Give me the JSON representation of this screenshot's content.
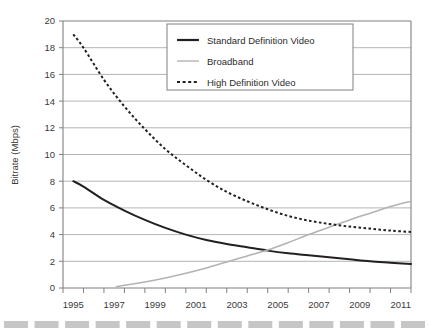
{
  "chart_data": {
    "type": "line",
    "title": "",
    "xlabel": "",
    "ylabel": "Bitrate (Mbps)",
    "xlim": [
      1995,
      2012
    ],
    "ylim": [
      0,
      20
    ],
    "ytick_step": 2,
    "grid": true,
    "grid_axis": "y",
    "legend_position": "top-center-right",
    "xticks": [
      1995,
      1996,
      1997,
      1998,
      1999,
      2000,
      2001,
      2002,
      2003,
      2004,
      2005,
      2006,
      2007,
      2008,
      2009,
      2010,
      2011,
      2012
    ],
    "xtick_labels": [
      "1995",
      "1997",
      "1999",
      "2001",
      "2003",
      "2005",
      "2007",
      "2009",
      "2011"
    ],
    "xtick_label_years": [
      1995,
      1997,
      1999,
      2001,
      2003,
      2005,
      2007,
      2009,
      2011
    ],
    "yticks": [
      0,
      2,
      4,
      6,
      8,
      10,
      12,
      14,
      16,
      18,
      20
    ],
    "ytick_labels": [
      "0",
      "2",
      "4",
      "6",
      "8",
      "10",
      "12",
      "14",
      "16",
      "18",
      "20"
    ],
    "series": [
      {
        "name": "Standard Definition Video",
        "style": "solid",
        "color": "#231f20",
        "width": 2.0,
        "x": [
          1995.5,
          1996,
          1997,
          1998,
          1999,
          2000,
          2001,
          2002,
          2003,
          2004,
          2005,
          2006,
          2007,
          2008,
          2009,
          2010,
          2011,
          2012
        ],
        "y": [
          8.0,
          7.6,
          6.6,
          5.8,
          5.1,
          4.5,
          4.0,
          3.6,
          3.3,
          3.05,
          2.8,
          2.6,
          2.45,
          2.3,
          2.15,
          2.0,
          1.9,
          1.8
        ]
      },
      {
        "name": "Broadband",
        "style": "solid",
        "color": "#b3b3b3",
        "width": 1.6,
        "x": [
          1997.6,
          1998,
          1999,
          2000,
          2001,
          2002,
          2003,
          2004,
          2005,
          2006,
          2007,
          2008,
          2009,
          2010,
          2011,
          2012
        ],
        "y": [
          0.1,
          0.2,
          0.45,
          0.75,
          1.1,
          1.5,
          1.95,
          2.4,
          2.85,
          3.4,
          4.0,
          4.55,
          5.1,
          5.6,
          6.1,
          6.5
        ]
      },
      {
        "name": "High Definition Video",
        "style": "dotted",
        "color": "#231f20",
        "width": 2.0,
        "x": [
          1995.5,
          1996,
          1997,
          1998,
          1999,
          2000,
          2001,
          2002,
          2003,
          2004,
          2005,
          2006,
          2007,
          2008,
          2009,
          2010,
          2011,
          2012
        ],
        "y": [
          19.0,
          18.0,
          15.6,
          13.6,
          11.9,
          10.4,
          9.2,
          8.1,
          7.2,
          6.5,
          5.9,
          5.4,
          5.05,
          4.8,
          4.6,
          4.45,
          4.3,
          4.2
        ]
      }
    ]
  },
  "legend": {
    "items": [
      {
        "label": "Standard Definition Video",
        "swatch": "solid-dark-thick"
      },
      {
        "label": "Broadband",
        "swatch": "solid-gray-thin"
      },
      {
        "label": "High Definition Video",
        "swatch": "dotted-dark"
      }
    ]
  },
  "axes": {
    "y_title": "Bitrate (Mbps)"
  },
  "decoration": {
    "footer_bar_name": "dashed-divider-bar",
    "footer_bar_color": "#c6c6c6",
    "footer_dash_count": 14
  },
  "colors": {
    "plot_frame": "#808080",
    "gridline": "#b5b5b5",
    "axis_text": "#3a3a3a",
    "series_dark": "#231f20",
    "series_gray": "#b3b3b3",
    "footer": "#c6c6c6"
  }
}
